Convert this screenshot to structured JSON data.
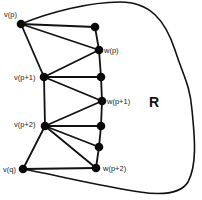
{
  "diagram": {
    "region_label": "R",
    "nodes": [
      {
        "id": "vp",
        "label": "v(p)",
        "x": 21,
        "y": 24
      },
      {
        "id": "n1",
        "label": "",
        "x": 95,
        "y": 27
      },
      {
        "id": "wp",
        "label": "w(p)",
        "x": 99,
        "y": 50
      },
      {
        "id": "vp1",
        "label": "v(p+1)",
        "x": 44,
        "y": 77
      },
      {
        "id": "n3",
        "label": "",
        "x": 101,
        "y": 77
      },
      {
        "id": "wp1",
        "label": "w(p+1)",
        "x": 102,
        "y": 101
      },
      {
        "id": "vp2",
        "label": "v(p+2)",
        "x": 45,
        "y": 126
      },
      {
        "id": "n5",
        "label": "",
        "x": 101,
        "y": 126
      },
      {
        "id": "n6",
        "label": "",
        "x": 99,
        "y": 147
      },
      {
        "id": "wp2",
        "label": "w(p+2)",
        "x": 96,
        "y": 168
      },
      {
        "id": "vq",
        "label": "v(q)",
        "x": 23,
        "y": 169
      }
    ],
    "edges": [
      [
        "vp",
        "n1"
      ],
      [
        "vp",
        "wp"
      ],
      [
        "vp",
        "vp1"
      ],
      [
        "n1",
        "wp"
      ],
      [
        "wp",
        "n3"
      ],
      [
        "n3",
        "wp1"
      ],
      [
        "wp1",
        "n5"
      ],
      [
        "n5",
        "n6"
      ],
      [
        "n6",
        "wp2"
      ],
      [
        "vp1",
        "wp"
      ],
      [
        "vp1",
        "n3"
      ],
      [
        "vp1",
        "wp1"
      ],
      [
        "vp1",
        "vp2"
      ],
      [
        "vp2",
        "wp1"
      ],
      [
        "vp2",
        "n5"
      ],
      [
        "vp2",
        "n6"
      ],
      [
        "vp2",
        "wp2"
      ],
      [
        "vp2",
        "vq"
      ],
      [
        "vq",
        "wp2"
      ]
    ],
    "labels": {
      "vp": "v(p)",
      "wp": "w(p)",
      "vp1": "v(p+1)",
      "wp1": "w(p+1)",
      "vp2": "v(p+2)",
      "wp2": "w(p+2)",
      "vq": "v(q)"
    }
  }
}
